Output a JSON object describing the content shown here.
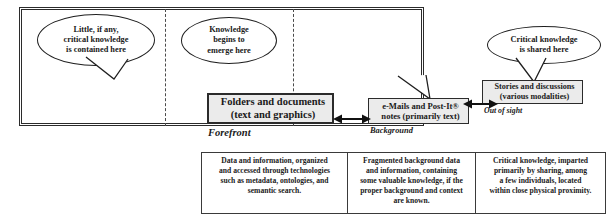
{
  "diagram": {
    "colors": {
      "box_fill": "#ebebeb",
      "border": "#2b2b2b",
      "balloon_fill": "#ffffff",
      "divider": "#4a4a4a"
    },
    "balloons": [
      {
        "name": "little-critical-knowledge",
        "lines": [
          "Little, if any,",
          "critical knowledge",
          "is contained here"
        ]
      },
      {
        "name": "knowledge-begins-to-emerge",
        "lines": [
          "Knowledge",
          "begins to",
          "emerge here"
        ]
      },
      {
        "name": "critical-knowledge-shared",
        "lines": [
          "Critical knowledge",
          "is shared here"
        ]
      }
    ],
    "nodes": [
      {
        "name": "folders-and-documents",
        "lines": [
          "Folders and documents",
          "(text and graphics)"
        ],
        "caption": "Forefront"
      },
      {
        "name": "emails-and-postit-notes",
        "lines": [
          "e-Mails and Post-It®",
          "notes (primarily text)"
        ],
        "caption": "Background"
      },
      {
        "name": "stories-and-discussions",
        "lines": [
          "Stories and discussions",
          "(various modalities)"
        ],
        "caption": "Out of sight"
      }
    ],
    "connectors": [
      {
        "name": "arrow-folders-emails",
        "style": "double-headed"
      },
      {
        "name": "arrow-emails-stories",
        "style": "double-headed"
      }
    ],
    "table": {
      "cells": [
        {
          "name": "description-data-information",
          "lines": [
            "Data and information, organized",
            "and accessed through technologies",
            "such as metadata, ontologies, and",
            "semantic search."
          ]
        },
        {
          "name": "description-fragmented-background",
          "lines": [
            "Fragmented background data",
            "and information, containing",
            "some valuable knowledge, if the",
            "proper background and context",
            "are known."
          ]
        },
        {
          "name": "description-critical-knowledge",
          "lines": [
            "Critical knowledge, imparted",
            "primarily by sharing, among",
            "a few individuals, located",
            "within close physical proximity."
          ]
        }
      ]
    }
  }
}
